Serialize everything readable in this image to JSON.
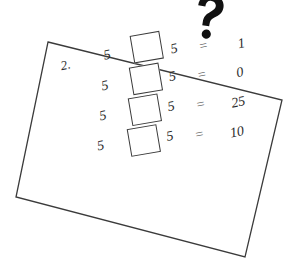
{
  "page": {
    "background_color": "#ffffff",
    "ink_color": "#2b2b2b",
    "question_mark": "?"
  },
  "worksheet": {
    "item_number": "2.",
    "paper_border_color": "#3b3b3b",
    "rows": [
      {
        "left_operand": "5",
        "operator_box": "",
        "right_operand": "5",
        "equals": "=",
        "result": "1"
      },
      {
        "left_operand": "5",
        "operator_box": "",
        "right_operand": "5",
        "equals": "=",
        "result": "0"
      },
      {
        "left_operand": "5",
        "operator_box": "",
        "right_operand": "5",
        "equals": "=",
        "result": "25"
      },
      {
        "left_operand": "5",
        "operator_box": "",
        "right_operand": "5",
        "equals": "=",
        "result": "10"
      }
    ]
  }
}
